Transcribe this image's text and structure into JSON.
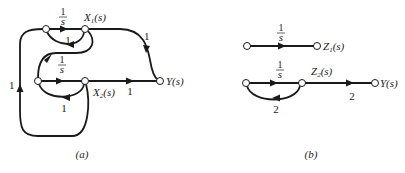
{
  "figure_a": {
    "caption": "(a)",
    "nodes": {
      "top_left": "",
      "x1": {
        "name": "X",
        "sub": "1",
        "arg": "(s)"
      },
      "mid_left": "",
      "x2": {
        "name": "X",
        "sub": "2",
        "arg": "(s)"
      },
      "y": "Y(s)"
    },
    "gains": {
      "top_integrator_num": "1",
      "top_integrator_den": "s",
      "top_feedback": "1",
      "x1_to_y": "1",
      "x1_to_mid_num": "1",
      "x1_to_mid_den": "s",
      "x2_feedback": "1",
      "x2_to_y": "1",
      "outer_feedback": "1"
    }
  },
  "figure_b": {
    "caption": "(b)",
    "nodes": {
      "z1": {
        "name": "Z",
        "sub": "1",
        "arg": "(s)"
      },
      "z2": {
        "name": "Z",
        "sub": "2",
        "arg": "(s)"
      },
      "y": "Y(s)"
    },
    "gains": {
      "z1_integrator_num": "1",
      "z1_integrator_den": "s",
      "z2_integrator_num": "1",
      "z2_integrator_den": "s",
      "z2_feedback": "2",
      "z2_to_y": "2"
    }
  }
}
